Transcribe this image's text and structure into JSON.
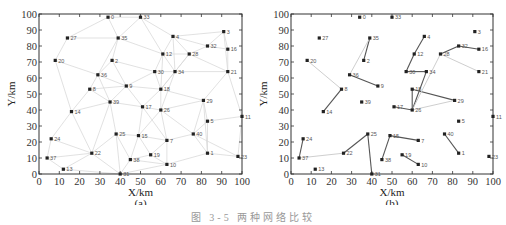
{
  "caption": "图 3-5  两种网络比较",
  "chart_data": [
    {
      "type": "scatter",
      "title": "",
      "panel_label": "(a)",
      "xlabel": "X/km",
      "ylabel": "Y/km",
      "xlim": [
        0,
        100
      ],
      "ylim": [
        0,
        100
      ],
      "xticks": [
        0,
        10,
        20,
        30,
        40,
        50,
        60,
        70,
        80,
        90,
        100
      ],
      "yticks": [
        0,
        10,
        20,
        30,
        40,
        50,
        60,
        70,
        80,
        90,
        100
      ],
      "grid": false,
      "nodes": [
        {
          "id": "0",
          "x": 34,
          "y": 98
        },
        {
          "id": "33",
          "x": 50,
          "y": 98
        },
        {
          "id": "27",
          "x": 14,
          "y": 85
        },
        {
          "id": "35",
          "x": 39,
          "y": 85
        },
        {
          "id": "4",
          "x": 66,
          "y": 86
        },
        {
          "id": "3",
          "x": 91,
          "y": 89
        },
        {
          "id": "32",
          "x": 83,
          "y": 80
        },
        {
          "id": "16",
          "x": 93,
          "y": 78
        },
        {
          "id": "12",
          "x": 61,
          "y": 75
        },
        {
          "id": "28",
          "x": 74,
          "y": 75
        },
        {
          "id": "20",
          "x": 8,
          "y": 71
        },
        {
          "id": "2",
          "x": 36,
          "y": 71
        },
        {
          "id": "30",
          "x": 57,
          "y": 64
        },
        {
          "id": "34",
          "x": 67,
          "y": 64
        },
        {
          "id": "21",
          "x": 93,
          "y": 64
        },
        {
          "id": "36",
          "x": 29,
          "y": 62
        },
        {
          "id": "8",
          "x": 25,
          "y": 53
        },
        {
          "id": "9",
          "x": 43,
          "y": 55
        },
        {
          "id": "18",
          "x": 60,
          "y": 53
        },
        {
          "id": "29",
          "x": 81,
          "y": 46
        },
        {
          "id": "39",
          "x": 35,
          "y": 45
        },
        {
          "id": "17",
          "x": 51,
          "y": 42
        },
        {
          "id": "26",
          "x": 60,
          "y": 40
        },
        {
          "id": "14",
          "x": 16,
          "y": 39
        },
        {
          "id": "5",
          "x": 83,
          "y": 33
        },
        {
          "id": "11",
          "x": 100,
          "y": 36
        },
        {
          "id": "25",
          "x": 38,
          "y": 25
        },
        {
          "id": "15",
          "x": 49,
          "y": 24
        },
        {
          "id": "7",
          "x": 63,
          "y": 21
        },
        {
          "id": "40",
          "x": 76,
          "y": 25
        },
        {
          "id": "24",
          "x": 6,
          "y": 22
        },
        {
          "id": "22",
          "x": 26,
          "y": 13
        },
        {
          "id": "19",
          "x": 55,
          "y": 12
        },
        {
          "id": "1",
          "x": 83,
          "y": 13
        },
        {
          "id": "37",
          "x": 4,
          "y": 10
        },
        {
          "id": "38",
          "x": 45,
          "y": 9
        },
        {
          "id": "23",
          "x": 98,
          "y": 11
        },
        {
          "id": "10",
          "x": 63,
          "y": 6
        },
        {
          "id": "13",
          "x": 12,
          "y": 3
        },
        {
          "id": "31",
          "x": 40,
          "y": 0
        }
      ],
      "edges": [
        [
          "27",
          "0"
        ],
        [
          "0",
          "35"
        ],
        [
          "0",
          "33"
        ],
        [
          "27",
          "35"
        ],
        [
          "33",
          "35"
        ],
        [
          "33",
          "4"
        ],
        [
          "33",
          "12"
        ],
        [
          "35",
          "2"
        ],
        [
          "35",
          "36"
        ],
        [
          "35",
          "12"
        ],
        [
          "4",
          "3"
        ],
        [
          "4",
          "12"
        ],
        [
          "4",
          "32"
        ],
        [
          "4",
          "28"
        ],
        [
          "4",
          "34"
        ],
        [
          "3",
          "32"
        ],
        [
          "3",
          "16"
        ],
        [
          "3",
          "21"
        ],
        [
          "32",
          "16"
        ],
        [
          "32",
          "28"
        ],
        [
          "16",
          "21"
        ],
        [
          "28",
          "21"
        ],
        [
          "28",
          "12"
        ],
        [
          "28",
          "34"
        ],
        [
          "28",
          "18"
        ],
        [
          "20",
          "27"
        ],
        [
          "20",
          "36"
        ],
        [
          "2",
          "36"
        ],
        [
          "2",
          "9"
        ],
        [
          "2",
          "30"
        ],
        [
          "12",
          "30"
        ],
        [
          "12",
          "34"
        ],
        [
          "12",
          "18"
        ],
        [
          "30",
          "9"
        ],
        [
          "30",
          "18"
        ],
        [
          "30",
          "34"
        ],
        [
          "34",
          "18"
        ],
        [
          "34",
          "26"
        ],
        [
          "34",
          "21"
        ],
        [
          "36",
          "8"
        ],
        [
          "36",
          "9"
        ],
        [
          "36",
          "39"
        ],
        [
          "8",
          "9"
        ],
        [
          "8",
          "14"
        ],
        [
          "8",
          "39"
        ],
        [
          "9",
          "18"
        ],
        [
          "9",
          "17"
        ],
        [
          "9",
          "39"
        ],
        [
          "18",
          "29"
        ],
        [
          "18",
          "26"
        ],
        [
          "18",
          "17"
        ],
        [
          "29",
          "21"
        ],
        [
          "29",
          "26"
        ],
        [
          "29",
          "5"
        ],
        [
          "29",
          "1"
        ],
        [
          "29",
          "40"
        ],
        [
          "39",
          "17"
        ],
        [
          "39",
          "25"
        ],
        [
          "39",
          "22"
        ],
        [
          "17",
          "26"
        ],
        [
          "17",
          "15"
        ],
        [
          "17",
          "7"
        ],
        [
          "26",
          "15"
        ],
        [
          "26",
          "7"
        ],
        [
          "26",
          "40"
        ],
        [
          "14",
          "24"
        ],
        [
          "14",
          "22"
        ],
        [
          "14",
          "20"
        ],
        [
          "14",
          "39"
        ],
        [
          "5",
          "11"
        ],
        [
          "5",
          "40"
        ],
        [
          "5",
          "1"
        ],
        [
          "11",
          "23"
        ],
        [
          "11",
          "21"
        ],
        [
          "25",
          "15"
        ],
        [
          "25",
          "22"
        ],
        [
          "25",
          "31"
        ],
        [
          "25",
          "38"
        ],
        [
          "15",
          "7"
        ],
        [
          "15",
          "38"
        ],
        [
          "15",
          "19"
        ],
        [
          "7",
          "40"
        ],
        [
          "7",
          "19"
        ],
        [
          "7",
          "10"
        ],
        [
          "40",
          "1"
        ],
        [
          "40",
          "23"
        ],
        [
          "24",
          "37"
        ],
        [
          "24",
          "22"
        ],
        [
          "22",
          "37"
        ],
        [
          "22",
          "31"
        ],
        [
          "22",
          "13"
        ],
        [
          "19",
          "38"
        ],
        [
          "19",
          "10"
        ],
        [
          "1",
          "23"
        ],
        [
          "1",
          "10"
        ],
        [
          "37",
          "13"
        ],
        [
          "38",
          "31"
        ],
        [
          "31",
          "10"
        ],
        [
          "13",
          "31"
        ],
        [
          "38",
          "10"
        ]
      ]
    },
    {
      "type": "scatter",
      "title": "",
      "panel_label": "(b)",
      "xlabel": "X/km",
      "ylabel": "Y/km",
      "xlim": [
        0,
        100
      ],
      "ylim": [
        0,
        100
      ],
      "xticks": [
        0,
        10,
        20,
        30,
        40,
        50,
        60,
        70,
        80,
        90,
        100
      ],
      "yticks": [
        0,
        10,
        20,
        30,
        40,
        50,
        60,
        70,
        80,
        90,
        100
      ],
      "grid": false,
      "nodes_same_as": "(a)",
      "edges": [
        {
          "a": "35",
          "b": "2",
          "strength": "dark"
        },
        {
          "a": "35",
          "b": "36",
          "strength": "light"
        },
        {
          "a": "36",
          "b": "9",
          "strength": "dark"
        },
        {
          "a": "20",
          "b": "8",
          "strength": "light"
        },
        {
          "a": "8",
          "b": "14",
          "strength": "dark"
        },
        {
          "a": "4",
          "b": "12",
          "strength": "dark"
        },
        {
          "a": "12",
          "b": "30",
          "strength": "dark"
        },
        {
          "a": "30",
          "b": "34",
          "strength": "dark"
        },
        {
          "a": "34",
          "b": "26",
          "strength": "dark"
        },
        {
          "a": "18",
          "b": "26",
          "strength": "dark"
        },
        {
          "a": "18",
          "b": "29",
          "strength": "dark"
        },
        {
          "a": "26",
          "b": "29",
          "strength": "light"
        },
        {
          "a": "17",
          "b": "26",
          "strength": "dark"
        },
        {
          "a": "28",
          "b": "26",
          "strength": "light"
        },
        {
          "a": "28",
          "b": "32",
          "strength": "dark"
        },
        {
          "a": "32",
          "b": "16",
          "strength": "dark"
        },
        {
          "a": "28",
          "b": "21",
          "strength": "light"
        },
        {
          "a": "25",
          "b": "22",
          "strength": "dark"
        },
        {
          "a": "25",
          "b": "31",
          "strength": "dark"
        },
        {
          "a": "15",
          "b": "38",
          "strength": "dark"
        },
        {
          "a": "15",
          "b": "7",
          "strength": "dark"
        },
        {
          "a": "19",
          "b": "10",
          "strength": "dark"
        },
        {
          "a": "40",
          "b": "1",
          "strength": "dark"
        },
        {
          "a": "24",
          "b": "37",
          "strength": "dark"
        },
        {
          "a": "37",
          "b": "22",
          "strength": "light"
        }
      ]
    }
  ]
}
